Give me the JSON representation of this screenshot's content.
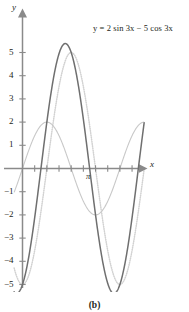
{
  "figure": {
    "caption": "(b)",
    "equation_label": "y = 2 sin 3x − 5 cos 3x",
    "x_axis_name": "x",
    "y_axis_name": "y",
    "pi_tick_label": "π"
  },
  "colors": {
    "axis": "#8a8a8a",
    "resultant_curve": "#6f6f6f",
    "sine_component_curve": "#c8c8c8",
    "cosine_component_curve": "#d2d2d2",
    "text": "#231f20",
    "background": "#ffffff"
  },
  "chart_data": {
    "type": "line",
    "title": "y = 2 sin 3x − 5 cos 3x",
    "xlabel": "x",
    "ylabel": "y",
    "xlim": [
      -0.18,
      2.62
    ],
    "ylim": [
      -5.6,
      5.6
    ],
    "grid": false,
    "legend": "none",
    "y_tick_labels": [
      "5",
      "4",
      "3",
      "2",
      "1",
      "−1",
      "−2",
      "−3",
      "−4",
      "−5"
    ],
    "y_ticks": [
      5,
      4,
      3,
      2,
      1,
      -1,
      -2,
      -3,
      -4,
      -5
    ],
    "x_ticks": [
      0,
      0.2618,
      0.5236,
      0.7854,
      1.0472,
      1.309,
      1.5708,
      1.8326,
      2.0944,
      2.3562
    ],
    "x_tick_labels": [
      "",
      "",
      "",
      "",
      "",
      "",
      "π",
      "",
      "",
      ""
    ],
    "pi_tick_value": 3.14159,
    "annotations": [
      {
        "text": "y = 2 sin 3x − 5 cos 3x",
        "x": 1.55,
        "y": 5.6
      }
    ],
    "series": [
      {
        "name": "y = 2 sin 3x − 5 cos 3x",
        "style": "solid",
        "color": "#6f6f6f",
        "amplitude": 5.385,
        "period": 2.0944,
        "phase_shift": -0.3805,
        "formula": "2*sin(3x) - 5*cos(3x)",
        "key_points": [
          {
            "x": 0.0,
            "y": -5.0
          },
          {
            "x": 0.127,
            "y": 0.0
          },
          {
            "x": 0.476,
            "y": 5.385
          },
          {
            "x": 0.651,
            "y": 0.0
          },
          {
            "x": 1.0,
            "y": -5.385
          },
          {
            "x": 1.175,
            "y": 0.0
          },
          {
            "x": 1.524,
            "y": 5.385
          },
          {
            "x": 1.699,
            "y": 0.0
          },
          {
            "x": 2.047,
            "y": -5.385
          },
          {
            "x": 2.223,
            "y": 0.0
          },
          {
            "x": 2.571,
            "y": 5.385
          }
        ]
      },
      {
        "name": "2 sin 3x",
        "style": "solid-light",
        "color": "#c8c8c8",
        "amplitude": 2,
        "period": 2.0944,
        "formula": "2*sin(3x)",
        "key_points": [
          {
            "x": 0.0,
            "y": 0.0
          },
          {
            "x": 0.524,
            "y": 2.0
          },
          {
            "x": 1.047,
            "y": 0.0
          },
          {
            "x": 1.571,
            "y": -2.0
          },
          {
            "x": 2.094,
            "y": 0.0
          },
          {
            "x": 2.618,
            "y": 2.0
          }
        ]
      },
      {
        "name": "−5 cos 3x",
        "style": "dotted",
        "color": "#d2d2d2",
        "amplitude": 5,
        "period": 2.0944,
        "formula": "-5*cos(3x)",
        "key_points": [
          {
            "x": 0.0,
            "y": -5.0
          },
          {
            "x": 0.524,
            "y": 0.0
          },
          {
            "x": 1.047,
            "y": 5.0
          },
          {
            "x": 1.571,
            "y": 0.0
          },
          {
            "x": 2.094,
            "y": -5.0
          },
          {
            "x": 2.618,
            "y": 0.0
          }
        ]
      }
    ]
  }
}
